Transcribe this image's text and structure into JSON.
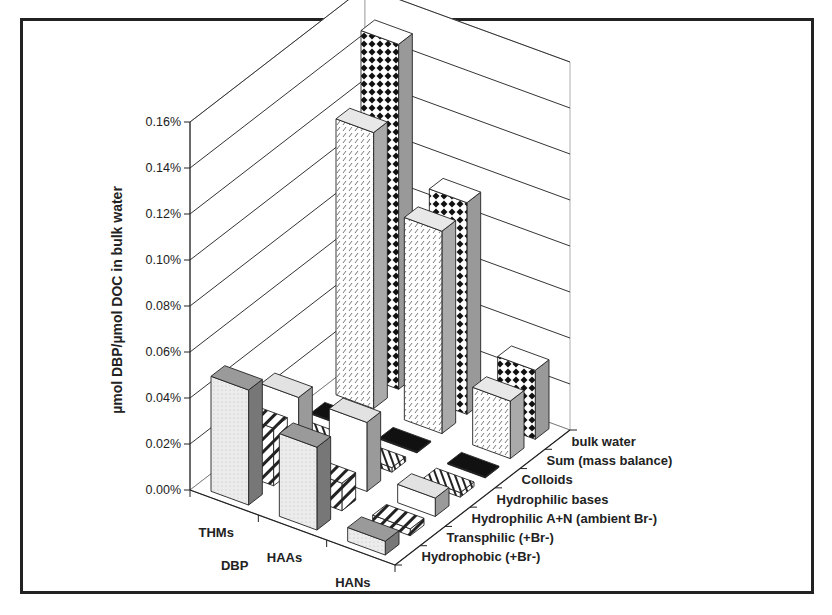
{
  "chart_data": {
    "type": "bar",
    "subtype": "3d-column",
    "title": "",
    "xlabel": "DBP",
    "ylabel": "µmol DBP/µmol DOC in bulk water",
    "zlabel": "",
    "categories": [
      "THMs",
      "HAAs",
      "HANs"
    ],
    "depth_categories": [
      "Hydrophobic (+Br-)",
      "Transphilic (+Br-)",
      "Hydrophilic A+N (ambient Br-)",
      "Hydrophilic bases",
      "Colloids",
      "Sum (mass balance)",
      "bulk water"
    ],
    "series": [
      {
        "name": "Hydrophobic (+Br-)",
        "pattern": "light-dotted",
        "values": [
          0.05,
          0.036,
          0.006
        ]
      },
      {
        "name": "Transphilic (+Br-)",
        "pattern": "diagonal-stripes",
        "values": [
          0.025,
          0.012,
          0.003
        ]
      },
      {
        "name": "Hydrophilic A+N (ambient Br-)",
        "pattern": "white",
        "values": [
          0.03,
          0.03,
          0.008
        ]
      },
      {
        "name": "Hydrophilic bases",
        "pattern": "vertical-stripes",
        "values": [
          0.002,
          0.002,
          0.002
        ]
      },
      {
        "name": "Colloids",
        "pattern": "solid-black",
        "values": [
          0.0005,
          0.0005,
          0.0005
        ]
      },
      {
        "name": "Sum (mass balance)",
        "pattern": "fine-hatch",
        "values": [
          0.12,
          0.088,
          0.025
        ]
      },
      {
        "name": "bulk water",
        "pattern": "checker-diamond",
        "values": [
          0.15,
          0.092,
          0.03
        ]
      }
    ],
    "unit": "%",
    "yticks": [
      "0.00%",
      "0.02%",
      "0.04%",
      "0.06%",
      "0.08%",
      "0.10%",
      "0.12%",
      "0.14%",
      "0.16%"
    ],
    "ylim": [
      0,
      0.16
    ],
    "grid": true,
    "legend": "none (depth axis labels)"
  },
  "labels": {
    "ylabel": "µmol DBP/µmol DOC in bulk water",
    "xlabel": "DBP",
    "yticks": [
      "0.00%",
      "0.02%",
      "0.04%",
      "0.06%",
      "0.08%",
      "0.10%",
      "0.12%",
      "0.14%",
      "0.16%"
    ],
    "categories": [
      "THMs",
      "HAAs",
      "HANs"
    ],
    "depth": [
      "Hydrophobic (+Br-)",
      "Transphilic (+Br-)",
      "Hydrophilic A+N (ambient Br-)",
      "Hydrophilic bases",
      "Colloids",
      "Sum (mass balance)",
      "bulk water"
    ]
  }
}
